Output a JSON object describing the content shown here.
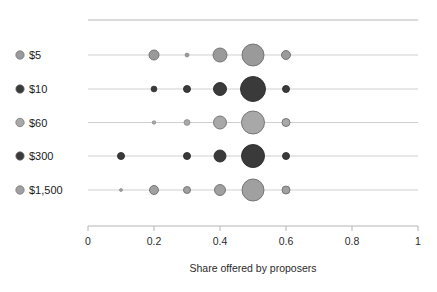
{
  "chart_data": {
    "type": "scatter",
    "variant": "bubble-rows",
    "title": "",
    "subtitle": "",
    "xlabel": "Share offered by proposers",
    "ylabel": "",
    "xlim": [
      0,
      1
    ],
    "xticks": [
      0,
      0.2,
      0.4,
      0.6,
      0.8,
      1
    ],
    "xtick_labels": [
      "0",
      "0.2",
      "0.4",
      "0.6",
      "0.8",
      "1"
    ],
    "grid": false,
    "row_rules": true,
    "top_rule": true,
    "legend_position": "left-axis",
    "categories": [
      "$5",
      "$10",
      "$60",
      "$300",
      "$1,500"
    ],
    "series": [
      {
        "name": "$5",
        "color": "#9a9a9a",
        "edge": "#6e6e6e",
        "x": [
          0.2,
          0.3,
          0.4,
          0.5,
          0.6
        ],
        "sizes": [
          5.0,
          2.0,
          7.0,
          11.0,
          4.5
        ]
      },
      {
        "name": "$10",
        "color": "#3a3a3a",
        "edge": "#2a2a2a",
        "x": [
          0.2,
          0.3,
          0.4,
          0.5,
          0.6
        ],
        "sizes": [
          3.0,
          3.5,
          6.5,
          12.5,
          3.5
        ]
      },
      {
        "name": "$60",
        "color": "#a8a8a8",
        "edge": "#6e6e6e",
        "x": [
          0.2,
          0.3,
          0.4,
          0.5,
          0.6
        ],
        "sizes": [
          1.8,
          3.0,
          6.5,
          11.5,
          4.0
        ]
      },
      {
        "name": "$300",
        "color": "#3a3a3a",
        "edge": "#2a2a2a",
        "x": [
          0.1,
          0.3,
          0.4,
          0.5,
          0.6
        ],
        "sizes": [
          3.5,
          3.5,
          6.0,
          11.5,
          3.5
        ]
      },
      {
        "name": "$1,500",
        "color": "#a0a0a0",
        "edge": "#6e6e6e",
        "x": [
          0.1,
          0.2,
          0.3,
          0.4,
          0.5,
          0.6
        ],
        "sizes": [
          1.5,
          4.5,
          3.5,
          5.5,
          11.0,
          4.0
        ]
      }
    ]
  },
  "axis": {
    "title": "Share offered by proposers",
    "tick_0": "0",
    "tick_1": "0.2",
    "tick_2": "0.4",
    "tick_3": "0.6",
    "tick_4": "0.8",
    "tick_5": "1"
  },
  "legend": {
    "items": [
      {
        "label": "$5",
        "color": "#9a9a9a"
      },
      {
        "label": "$10",
        "color": "#3a3a3a"
      },
      {
        "label": "$60",
        "color": "#a8a8a8"
      },
      {
        "label": "$300",
        "color": "#3a3a3a"
      },
      {
        "label": "$1,500",
        "color": "#a0a0a0"
      }
    ]
  },
  "colors": {
    "light_gray_marker": "#9a9a9a",
    "dark_marker": "#3a3a3a",
    "rule": "#cfcfcf",
    "axis": "#b5b5b5",
    "text": "#1a1a1a"
  }
}
